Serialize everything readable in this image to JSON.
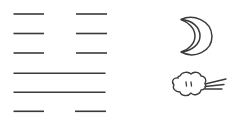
{
  "figure": {
    "hexagram": {
      "lines": [
        {
          "position": 1,
          "type": "yin"
        },
        {
          "position": 2,
          "type": "yin"
        },
        {
          "position": 3,
          "type": "yin"
        },
        {
          "position": 4,
          "type": "yang"
        },
        {
          "position": 5,
          "type": "yang"
        },
        {
          "position": 6,
          "type": "yin"
        }
      ]
    },
    "icons": {
      "top": "crescent-moon-icon",
      "bottom": "wind-cloud-icon"
    },
    "colors": {
      "stroke": "#3a3a3a",
      "background": "#ffffff"
    }
  }
}
